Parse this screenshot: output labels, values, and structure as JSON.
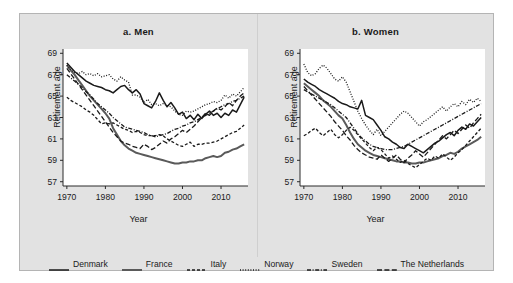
{
  "figure": {
    "background": "#e2e2e2",
    "panel_background": "#ffffff"
  },
  "panels": [
    {
      "key": "men",
      "title": "a. Men"
    },
    {
      "key": "women",
      "title": "b. Women"
    }
  ],
  "axis": {
    "ylabel": "Retirement age",
    "xlabel": "Year",
    "yticks": [
      57,
      59,
      61,
      63,
      65,
      67,
      69
    ],
    "xticks": [
      1970,
      1980,
      1990,
      2000,
      2010
    ],
    "ylim": [
      56.6,
      69.4
    ],
    "xlim": [
      1969,
      2017
    ]
  },
  "legend": {
    "position": "bottom",
    "entries": [
      {
        "name": "Denmark",
        "style": "solid",
        "color": "#1a1a1a",
        "width": 1.5
      },
      {
        "name": "France",
        "style": "solid",
        "color": "#5a5a5a",
        "width": 2.0
      },
      {
        "name": "Italy",
        "style": "dashed",
        "color": "#1a1a1a",
        "width": 1.3
      },
      {
        "name": "Norway",
        "style": "dotted",
        "color": "#1a1a1a",
        "width": 1.3
      },
      {
        "name": "Sweden",
        "style": "dashdot",
        "color": "#1a1a1a",
        "width": 1.3
      },
      {
        "name": "The Netherlands",
        "style": "longdash",
        "color": "#1a1a1a",
        "width": 1.3
      }
    ]
  },
  "chart_data": {
    "type": "line",
    "xlabel": "Year",
    "ylabel": "Retirement age",
    "xlim": [
      1969,
      2017
    ],
    "ylim": [
      56.6,
      69.4
    ],
    "yticks": [
      57,
      59,
      61,
      63,
      65,
      67,
      69
    ],
    "xticks": [
      1970,
      1980,
      1990,
      2000,
      2010
    ],
    "grid": false,
    "legend_position": "bottom",
    "x": [
      1970,
      1971,
      1972,
      1973,
      1974,
      1975,
      1976,
      1977,
      1978,
      1979,
      1980,
      1981,
      1982,
      1983,
      1984,
      1985,
      1986,
      1987,
      1988,
      1989,
      1990,
      1991,
      1992,
      1993,
      1994,
      1995,
      1996,
      1997,
      1998,
      1999,
      2000,
      2001,
      2002,
      2003,
      2004,
      2005,
      2006,
      2007,
      2008,
      2009,
      2010,
      2011,
      2012,
      2013,
      2014,
      2015,
      2016
    ],
    "panels": [
      {
        "key": "men",
        "title": "a. Men",
        "series": [
          {
            "name": "Denmark",
            "style": "solid",
            "values": [
              68.1,
              67.7,
              67.3,
              67.0,
              66.7,
              66.4,
              66.2,
              66.0,
              65.9,
              65.8,
              65.6,
              65.5,
              65.3,
              65.6,
              65.9,
              66.0,
              65.6,
              65.3,
              65.6,
              65.2,
              64.3,
              64.1,
              63.9,
              64.5,
              65.3,
              64.6,
              64.0,
              64.4,
              63.9,
              63.3,
              63.5,
              62.9,
              63.2,
              62.8,
              63.3,
              62.9,
              63.3,
              63.6,
              63.2,
              63.4,
              63.0,
              63.4,
              63.2,
              63.7,
              63.5,
              64.2,
              64.9
            ]
          },
          {
            "name": "France",
            "style": "solid",
            "values": [
              67.9,
              67.4,
              67.0,
              66.5,
              66.0,
              65.5,
              65.0,
              64.6,
              64.2,
              63.8,
              63.4,
              62.9,
              62.0,
              61.4,
              60.8,
              60.4,
              60.1,
              59.9,
              59.7,
              59.6,
              59.5,
              59.4,
              59.3,
              59.2,
              59.1,
              59.0,
              58.9,
              58.8,
              58.7,
              58.7,
              58.8,
              58.8,
              58.9,
              58.9,
              59.0,
              59.0,
              59.2,
              59.3,
              59.4,
              59.3,
              59.4,
              59.7,
              59.8,
              60.0,
              60.1,
              60.3,
              60.5
            ]
          },
          {
            "name": "Italy",
            "style": "dashed",
            "values": [
              64.9,
              64.6,
              64.4,
              64.2,
              64.0,
              63.7,
              63.5,
              63.2,
              62.8,
              62.4,
              62.5,
              62.4,
              62.5,
              62.3,
              62.1,
              61.9,
              61.8,
              61.6,
              61.7,
              61.6,
              61.4,
              61.3,
              61.3,
              61.3,
              61.4,
              61.3,
              61.0,
              60.8,
              60.6,
              60.4,
              60.3,
              60.5,
              60.7,
              60.3,
              60.5,
              60.5,
              60.6,
              60.6,
              60.7,
              60.8,
              61.0,
              61.2,
              61.4,
              61.6,
              61.7,
              62.0,
              62.3
            ]
          },
          {
            "name": "Norway",
            "style": "dotted",
            "values": [
              67.9,
              67.5,
              67.2,
              67.1,
              67.3,
              67.0,
              67.1,
              66.9,
              67.1,
              66.8,
              66.9,
              67.0,
              66.6,
              66.4,
              66.8,
              66.5,
              66.3,
              65.1,
              65.1,
              64.9,
              64.4,
              64.7,
              64.2,
              64.3,
              64.1,
              64.3,
              64.1,
              64.0,
              63.6,
              63.3,
              63.2,
              63.6,
              63.5,
              63.6,
              63.8,
              64.0,
              64.2,
              64.3,
              64.5,
              64.4,
              64.6,
              65.1,
              64.8,
              65.2,
              65.0,
              65.4,
              65.8
            ]
          },
          {
            "name": "Sweden",
            "style": "dashdot",
            "values": [
              67.0,
              66.7,
              66.4,
              66.1,
              65.8,
              65.4,
              65.1,
              64.7,
              64.3,
              64.0,
              63.7,
              63.4,
              63.0,
              62.7,
              62.4,
              62.1,
              62.0,
              61.9,
              61.8,
              61.7,
              61.6,
              61.4,
              61.3,
              61.2,
              61.3,
              61.4,
              61.5,
              61.7,
              61.9,
              62.0,
              62.2,
              62.3,
              62.5,
              62.6,
              62.8,
              63.0,
              63.2,
              63.4,
              63.6,
              63.8,
              64.0,
              64.2,
              64.3,
              64.5,
              64.6,
              64.8,
              65.0
            ]
          },
          {
            "name": "The Netherlands",
            "style": "longdash",
            "values": [
              67.6,
              67.1,
              66.6,
              66.1,
              65.6,
              65.1,
              64.6,
              64.1,
              63.6,
              63.1,
              62.6,
              62.1,
              61.6,
              61.2,
              60.8,
              60.6,
              60.5,
              60.3,
              60.2,
              60.1,
              60.5,
              60.3,
              60.0,
              60.2,
              60.5,
              60.8,
              60.6,
              61.0,
              61.2,
              61.5,
              61.8,
              61.6,
              61.9,
              62.2,
              62.6,
              63.0,
              63.4,
              63.2,
              63.6,
              63.9,
              63.7,
              64.0,
              64.4,
              64.1,
              64.6,
              65.0,
              65.3
            ]
          }
        ]
      },
      {
        "key": "women",
        "title": "b. Women",
        "series": [
          {
            "name": "Denmark",
            "style": "solid",
            "values": [
              66.6,
              66.3,
              66.1,
              65.9,
              65.6,
              65.4,
              65.2,
              65.0,
              64.8,
              64.5,
              64.3,
              64.2,
              64.0,
              63.9,
              63.8,
              64.6,
              63.2,
              63.0,
              62.8,
              62.3,
              61.8,
              61.2,
              61.0,
              60.7,
              60.5,
              60.2,
              60.1,
              60.5,
              60.3,
              60.1,
              59.9,
              59.7,
              60.0,
              60.3,
              60.6,
              60.8,
              61.1,
              61.4,
              61.6,
              61.3,
              61.8,
              62.1,
              61.9,
              62.4,
              62.2,
              62.6,
              63.0
            ]
          },
          {
            "name": "France",
            "style": "solid",
            "values": [
              66.2,
              65.9,
              65.6,
              65.3,
              65.0,
              64.6,
              64.3,
              64.0,
              63.6,
              63.2,
              62.9,
              62.3,
              61.6,
              61.0,
              60.5,
              60.2,
              59.9,
              59.7,
              59.5,
              59.4,
              59.3,
              59.2,
              59.1,
              59.0,
              58.9,
              58.9,
              58.8,
              58.8,
              58.7,
              58.7,
              58.8,
              58.8,
              58.9,
              59.0,
              59.1,
              59.2,
              59.4,
              59.5,
              59.7,
              59.6,
              59.8,
              60.1,
              60.3,
              60.5,
              60.7,
              60.9,
              61.2
            ]
          },
          {
            "name": "Italy",
            "style": "dashed",
            "values": [
              61.3,
              61.5,
              61.8,
              62.0,
              61.6,
              61.3,
              61.6,
              61.9,
              61.4,
              61.1,
              61.4,
              61.8,
              62.1,
              61.8,
              61.4,
              61.0,
              60.6,
              60.2,
              59.9,
              60.2,
              60.0,
              59.6,
              59.2,
              59.4,
              59.1,
              58.8,
              59.0,
              58.7,
              58.5,
              58.3,
              58.6,
              58.9,
              59.2,
              59.0,
              59.4,
              59.2,
              59.6,
              59.3,
              59.0,
              59.3,
              59.7,
              60.0,
              60.4,
              60.8,
              61.2,
              61.6,
              62.0
            ]
          },
          {
            "name": "Norway",
            "style": "dotted",
            "values": [
              68.0,
              67.2,
              66.9,
              67.1,
              67.6,
              67.9,
              67.6,
              67.1,
              66.6,
              66.4,
              66.8,
              66.3,
              65.4,
              64.5,
              63.6,
              62.9,
              62.3,
              61.8,
              61.4,
              61.9,
              61.3,
              61.7,
              62.1,
              62.5,
              62.9,
              63.3,
              63.6,
              63.4,
              63.0,
              62.6,
              62.2,
              62.6,
              62.8,
              63.1,
              63.4,
              63.7,
              64.0,
              63.6,
              64.0,
              64.3,
              64.0,
              64.5,
              64.2,
              64.7,
              64.4,
              64.8,
              64.5
            ]
          },
          {
            "name": "Sweden",
            "style": "dashdot",
            "values": [
              65.6,
              65.4,
              65.2,
              65.0,
              64.8,
              64.6,
              64.4,
              64.2,
              63.9,
              63.6,
              63.3,
              63.0,
              62.5,
              62.0,
              61.5,
              61.1,
              60.8,
              60.5,
              60.3,
              60.2,
              60.1,
              60.0,
              60.0,
              60.0,
              60.1,
              60.2,
              60.3,
              60.5,
              60.7,
              60.9,
              61.1,
              61.3,
              61.5,
              61.7,
              61.9,
              62.1,
              62.3,
              62.5,
              62.7,
              62.9,
              63.1,
              63.3,
              63.5,
              63.7,
              63.9,
              64.1,
              64.3
            ]
          },
          {
            "name": "The Netherlands",
            "style": "longdash",
            "values": [
              65.9,
              65.5,
              65.1,
              64.7,
              64.3,
              63.9,
              63.5,
              63.1,
              62.6,
              62.2,
              61.8,
              61.3,
              60.9,
              60.4,
              60.0,
              59.7,
              59.5,
              59.3,
              59.2,
              59.1,
              59.5,
              59.2,
              58.9,
              59.2,
              59.5,
              59.1,
              58.8,
              59.2,
              59.5,
              59.9,
              59.6,
              59.3,
              59.7,
              60.1,
              60.5,
              60.9,
              61.3,
              61.0,
              61.4,
              61.8,
              61.5,
              61.9,
              62.3,
              62.0,
              62.5,
              62.9,
              63.3
            ]
          }
        ]
      }
    ]
  }
}
